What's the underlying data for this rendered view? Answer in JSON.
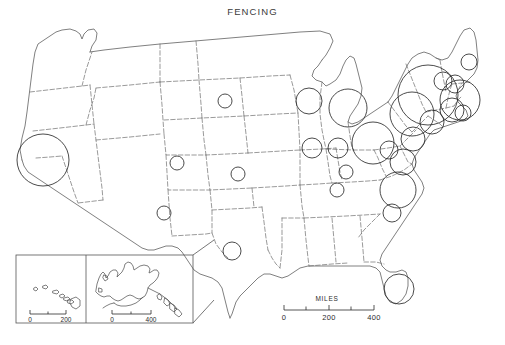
{
  "map": {
    "title": "FENCING",
    "projection_note": "",
    "background_color": "#ffffff",
    "border_color": "#6e6e6e",
    "coast_color": "#555555",
    "symbol_color": "#2b2b2b"
  },
  "scale_bar": {
    "label": "MILES",
    "ticks": [
      "0",
      "200",
      "400"
    ],
    "minor_ticks": 2
  },
  "insets": [
    {
      "name": "hawaii-inset",
      "scale_ticks": [
        "0",
        "200"
      ]
    },
    {
      "name": "alaska-inset",
      "scale_ticks": [
        "0",
        "400"
      ]
    }
  ],
  "chart_data": {
    "type": "scatter",
    "title": "FENCING",
    "subtitle": "",
    "xlabel": "",
    "ylabel": "",
    "legend_position": "none",
    "grid": false,
    "symbol": "proportional-circle",
    "units": "MILES",
    "scale_ticks": [
      0,
      200,
      400
    ],
    "categories": [
      "California",
      "South Dakota",
      "Colorado",
      "Kansas",
      "New Mexico",
      "Texas",
      "Wisconsin",
      "Michigan",
      "Illinois",
      "Indiana",
      "Ohio",
      "Kentucky",
      "Tennessee",
      "North Carolina",
      "South Carolina",
      "Florida",
      "Virginia",
      "West Virginia",
      "Maryland",
      "Pennsylvania",
      "New Jersey",
      "New York",
      "Connecticut",
      "Massachusetts",
      "Rhode Island",
      "New Hampshire",
      "Vermont",
      "Maine"
    ],
    "values": [
      26,
      7,
      7,
      7,
      7,
      9,
      13,
      19,
      10,
      10,
      21,
      7,
      7,
      18,
      9,
      15,
      13,
      9,
      12,
      22,
      12,
      30,
      12,
      20,
      8,
      9,
      9,
      8
    ],
    "points": [
      {
        "label": "California",
        "cx": 43,
        "cy": 160,
        "r": 26
      },
      {
        "label": "South Dakota",
        "cx": 225,
        "cy": 101,
        "r": 7
      },
      {
        "label": "Colorado",
        "cx": 177,
        "cy": 163,
        "r": 7
      },
      {
        "label": "Kansas",
        "cx": 238,
        "cy": 174,
        "r": 7
      },
      {
        "label": "New Mexico",
        "cx": 164,
        "cy": 213,
        "r": 7
      },
      {
        "label": "Texas",
        "cx": 232,
        "cy": 251,
        "r": 9
      },
      {
        "label": "Wisconsin",
        "cx": 309,
        "cy": 101,
        "r": 13
      },
      {
        "label": "Michigan",
        "cx": 348,
        "cy": 108,
        "r": 19
      },
      {
        "label": "Illinois",
        "cx": 312,
        "cy": 148,
        "r": 10
      },
      {
        "label": "Indiana",
        "cx": 338,
        "cy": 148,
        "r": 10
      },
      {
        "label": "Ohio",
        "cx": 373,
        "cy": 143,
        "r": 21
      },
      {
        "label": "Kentucky",
        "cx": 346,
        "cy": 172,
        "r": 7
      },
      {
        "label": "Tennessee",
        "cx": 337,
        "cy": 190,
        "r": 7
      },
      {
        "label": "North Carolina",
        "cx": 398,
        "cy": 190,
        "r": 18
      },
      {
        "label": "South Carolina",
        "cx": 392,
        "cy": 213,
        "r": 9
      },
      {
        "label": "Florida",
        "cx": 399,
        "cy": 289,
        "r": 15
      },
      {
        "label": "Virginia",
        "cx": 403,
        "cy": 162,
        "r": 13
      },
      {
        "label": "West Virginia",
        "cx": 389,
        "cy": 150,
        "r": 9
      },
      {
        "label": "Maryland",
        "cx": 413,
        "cy": 139,
        "r": 12
      },
      {
        "label": "Pennsylvania",
        "cx": 412,
        "cy": 114,
        "r": 22
      },
      {
        "label": "New Jersey",
        "cx": 432,
        "cy": 122,
        "r": 12
      },
      {
        "label": "New York",
        "cx": 428,
        "cy": 95,
        "r": 30
      },
      {
        "label": "Connecticut",
        "cx": 452,
        "cy": 110,
        "r": 12
      },
      {
        "label": "Massachusetts",
        "cx": 460,
        "cy": 100,
        "r": 20
      },
      {
        "label": "Rhode Island",
        "cx": 463,
        "cy": 113,
        "r": 8
      },
      {
        "label": "New Hampshire",
        "cx": 455,
        "cy": 84,
        "r": 9
      },
      {
        "label": "Vermont",
        "cx": 443,
        "cy": 81,
        "r": 9
      },
      {
        "label": "Maine",
        "cx": 469,
        "cy": 62,
        "r": 8
      }
    ]
  }
}
